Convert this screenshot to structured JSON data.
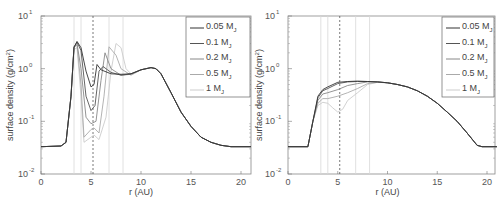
{
  "chart_data": [
    {
      "type": "line",
      "panel": "left",
      "xlabel": "r (AU)",
      "ylabel": "surface density (g/cm²)",
      "xlim": [
        0,
        21
      ],
      "ylim": [
        0.01,
        10
      ],
      "yscale": "log",
      "xticks": [
        "0",
        "5",
        "10",
        "15",
        "20"
      ],
      "yticks": [
        "10^-2",
        "10^-1",
        "10^0",
        "10^1"
      ],
      "legend": [
        "0.05 M_J",
        "0.1 M_J",
        "0.2 M_J",
        "0.5 M_J",
        "1 M_J"
      ],
      "legend_position": "upper right",
      "vertical_lines": {
        "dashed": [
          5.2
        ],
        "solid_light": [
          3.3,
          4.0,
          6.8,
          8.2
        ]
      },
      "series": [
        {
          "name": "0.05 M_J",
          "color": "#333333",
          "x": [
            0,
            2,
            2.5,
            3,
            3.3,
            3.6,
            4,
            4.5,
            5,
            5.3,
            5.6,
            6,
            7,
            8,
            9,
            10,
            11,
            11.5,
            12,
            13,
            14,
            15,
            16,
            17,
            18,
            19,
            20,
            21
          ],
          "y": [
            0.033,
            0.034,
            0.04,
            0.3,
            2.5,
            3.3,
            2.5,
            0.9,
            0.45,
            0.5,
            1.2,
            0.95,
            0.8,
            0.78,
            0.8,
            0.95,
            1.05,
            1.0,
            0.8,
            0.35,
            0.15,
            0.08,
            0.05,
            0.04,
            0.035,
            0.033,
            0.033,
            0.033
          ]
        },
        {
          "name": "0.1 M_J",
          "color": "#555555",
          "x": [
            0,
            2,
            2.5,
            3,
            3.3,
            3.6,
            4,
            4.5,
            5,
            5.4,
            5.8,
            6.2,
            7,
            8,
            9,
            10,
            11,
            11.5,
            12,
            13,
            14,
            15,
            16,
            17,
            18,
            19,
            20,
            21
          ],
          "y": [
            0.033,
            0.034,
            0.04,
            0.3,
            2.6,
            3.2,
            2.2,
            0.3,
            0.16,
            0.2,
            0.9,
            1.1,
            0.85,
            0.75,
            0.8,
            0.95,
            1.05,
            1.0,
            0.8,
            0.35,
            0.15,
            0.08,
            0.05,
            0.04,
            0.035,
            0.033,
            0.033,
            0.033
          ]
        },
        {
          "name": "0.2 M_J",
          "color": "#888888",
          "x": [
            0,
            2,
            2.5,
            3,
            3.3,
            3.6,
            4,
            4.5,
            5,
            5.5,
            6,
            6.4,
            7,
            8,
            9,
            10,
            11,
            11.5,
            12,
            13,
            14,
            15,
            16,
            17,
            18,
            19,
            20,
            21
          ],
          "y": [
            0.033,
            0.034,
            0.04,
            0.3,
            2.6,
            3.0,
            1.0,
            0.12,
            0.09,
            0.1,
            0.6,
            2.0,
            1.0,
            0.75,
            0.78,
            0.95,
            1.05,
            1.0,
            0.8,
            0.35,
            0.15,
            0.08,
            0.05,
            0.04,
            0.035,
            0.033,
            0.033,
            0.033
          ]
        },
        {
          "name": "0.5 M_J",
          "color": "#aaaaaa",
          "x": [
            0,
            2,
            2.5,
            3,
            3.3,
            3.6,
            4,
            4.3,
            5,
            5.3,
            5.8,
            6.3,
            6.8,
            7.5,
            8,
            9,
            10,
            11,
            11.5,
            12,
            13,
            14,
            15,
            16,
            17,
            18,
            19,
            20,
            21
          ],
          "y": [
            0.033,
            0.034,
            0.04,
            0.3,
            2.5,
            2.8,
            0.5,
            0.05,
            0.07,
            0.075,
            0.06,
            0.3,
            2.6,
            1.8,
            1.0,
            0.75,
            0.95,
            1.05,
            1.0,
            0.8,
            0.35,
            0.15,
            0.08,
            0.05,
            0.04,
            0.035,
            0.033,
            0.033,
            0.033
          ]
        },
        {
          "name": "1 M_J",
          "color": "#cccccc",
          "x": [
            0,
            2,
            2.5,
            3,
            3.3,
            3.6,
            4,
            4.3,
            5,
            5.3,
            5.8,
            6.5,
            7,
            7.5,
            8,
            8.5,
            9,
            10,
            11,
            11.5,
            12,
            13,
            14,
            15,
            16,
            17,
            18,
            19,
            20,
            21
          ],
          "y": [
            0.033,
            0.034,
            0.04,
            0.3,
            2.3,
            2.5,
            0.3,
            0.04,
            0.05,
            0.055,
            0.045,
            0.12,
            0.9,
            3.0,
            2.5,
            1.0,
            0.8,
            0.95,
            1.05,
            1.0,
            0.8,
            0.35,
            0.15,
            0.08,
            0.05,
            0.04,
            0.035,
            0.033,
            0.033,
            0.033
          ]
        }
      ]
    },
    {
      "type": "line",
      "panel": "right",
      "xlabel": "r (AU)",
      "ylabel": "surface density (g/cm²)",
      "xlim": [
        0,
        21
      ],
      "ylim": [
        0.01,
        10
      ],
      "yscale": "log",
      "xticks": [
        "0",
        "5",
        "10",
        "15",
        "20"
      ],
      "yticks": [
        "10^-2",
        "10^-1",
        "10^0",
        "10^1"
      ],
      "legend": [
        "0.05 M_J",
        "0.1 M_J",
        "0.2 M_J",
        "0.5 M_J",
        "1 M_J"
      ],
      "legend_position": "upper right",
      "vertical_lines": {
        "dashed": [
          5.2
        ],
        "solid_light": [
          3.3,
          4.0,
          6.8,
          8.2
        ]
      },
      "series": [
        {
          "name": "0.05 M_J",
          "color": "#333333",
          "x": [
            0,
            2,
            2.5,
            3,
            3.5,
            4,
            5,
            6,
            7,
            8,
            9,
            10,
            11,
            12,
            13,
            14,
            15,
            16,
            17,
            18,
            19,
            19.5,
            21
          ],
          "y": [
            0.033,
            0.033,
            0.1,
            0.3,
            0.4,
            0.45,
            0.55,
            0.57,
            0.58,
            0.57,
            0.56,
            0.54,
            0.5,
            0.45,
            0.38,
            0.3,
            0.22,
            0.15,
            0.1,
            0.06,
            0.035,
            0.033,
            0.033
          ]
        },
        {
          "name": "0.1 M_J",
          "color": "#555555",
          "x": [
            0,
            2,
            2.5,
            3,
            3.5,
            4,
            5,
            6,
            7,
            8,
            9,
            10,
            11,
            12,
            13,
            14,
            15,
            16,
            17,
            18,
            19,
            19.5,
            21
          ],
          "y": [
            0.033,
            0.033,
            0.1,
            0.28,
            0.38,
            0.42,
            0.52,
            0.56,
            0.57,
            0.57,
            0.56,
            0.54,
            0.5,
            0.45,
            0.38,
            0.3,
            0.22,
            0.15,
            0.1,
            0.06,
            0.035,
            0.033,
            0.033
          ]
        },
        {
          "name": "0.2 M_J",
          "color": "#888888",
          "x": [
            0,
            2,
            2.5,
            3,
            3.5,
            4,
            5,
            6,
            7,
            8,
            9,
            10,
            11,
            12,
            13,
            14,
            15,
            16,
            17,
            18,
            19,
            19.5,
            21
          ],
          "y": [
            0.033,
            0.033,
            0.1,
            0.25,
            0.33,
            0.35,
            0.4,
            0.48,
            0.52,
            0.56,
            0.56,
            0.54,
            0.5,
            0.45,
            0.38,
            0.3,
            0.22,
            0.15,
            0.1,
            0.06,
            0.035,
            0.033,
            0.033
          ]
        },
        {
          "name": "0.5 M_J",
          "color": "#aaaaaa",
          "x": [
            0,
            2,
            2.5,
            3,
            3.5,
            4,
            5,
            6,
            7,
            8,
            9,
            10,
            11,
            12,
            13,
            14,
            15,
            16,
            17,
            18,
            19,
            19.5,
            21
          ],
          "y": [
            0.033,
            0.033,
            0.1,
            0.22,
            0.27,
            0.27,
            0.3,
            0.35,
            0.42,
            0.52,
            0.55,
            0.54,
            0.5,
            0.45,
            0.38,
            0.3,
            0.22,
            0.15,
            0.1,
            0.06,
            0.035,
            0.033,
            0.033
          ]
        },
        {
          "name": "1 M_J",
          "color": "#cccccc",
          "x": [
            0,
            2,
            2.5,
            3,
            3.5,
            4,
            4.5,
            5,
            5.5,
            6,
            7,
            8,
            9,
            10,
            11,
            12,
            13,
            14,
            15,
            16,
            17,
            18,
            19,
            19.5,
            21
          ],
          "y": [
            0.033,
            0.033,
            0.1,
            0.2,
            0.23,
            0.22,
            0.18,
            0.15,
            0.17,
            0.25,
            0.35,
            0.5,
            0.55,
            0.54,
            0.5,
            0.45,
            0.38,
            0.3,
            0.22,
            0.15,
            0.1,
            0.06,
            0.035,
            0.033,
            0.033
          ]
        }
      ]
    }
  ],
  "panels": [
    {
      "xlabel": "r (AU)",
      "ylabel": "surface density (g/cm",
      "ylabel_sup": "2",
      "ylabel_end": ")",
      "xticks": [
        "0",
        "5",
        "10",
        "15",
        "20"
      ],
      "ytick_base": "10",
      "ytick_exps": [
        "-2",
        "-1",
        "0",
        "1"
      ],
      "legend": [
        {
          "label": "0.05 M",
          "sub": "J"
        },
        {
          "label": "0.1 M",
          "sub": "J"
        },
        {
          "label": "0.2 M",
          "sub": "J"
        },
        {
          "label": "0.5 M",
          "sub": "J"
        },
        {
          "label": "1 M",
          "sub": "J"
        }
      ]
    },
    {
      "xlabel": "r (AU)",
      "ylabel": "surface density (g/cm",
      "ylabel_sup": "2",
      "ylabel_end": ")",
      "xticks": [
        "0",
        "5",
        "10",
        "15",
        "20"
      ],
      "ytick_base": "10",
      "ytick_exps": [
        "-2",
        "-1",
        "0",
        "1"
      ],
      "legend": [
        {
          "label": "0.05 M",
          "sub": "J"
        },
        {
          "label": "0.1 M",
          "sub": "J"
        },
        {
          "label": "0.2 M",
          "sub": "J"
        },
        {
          "label": "0.5 M",
          "sub": "J"
        },
        {
          "label": "1 M",
          "sub": "J"
        }
      ]
    }
  ]
}
